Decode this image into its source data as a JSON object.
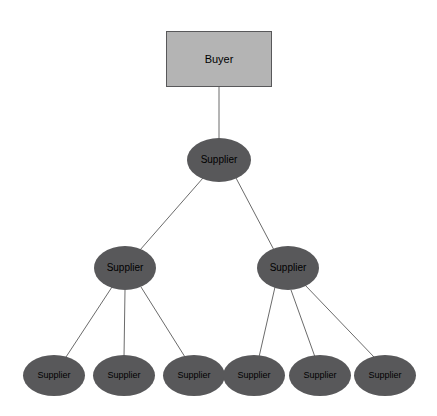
{
  "diagram": {
    "type": "tree",
    "background_color": "#ffffff",
    "style": {
      "buyer_fill": "#b4b4b4",
      "buyer_border": "#58585a",
      "supplier_fill": "#58585a",
      "label_color": "#000000",
      "edge_color": "#6b6b6b"
    },
    "nodes": [
      {
        "id": "buyer",
        "label": "Buyer",
        "shape": "rectangle",
        "tier": 0,
        "x": 219,
        "y": 59,
        "width": 106,
        "height": 56
      },
      {
        "id": "s1",
        "label": "Supplier",
        "shape": "ellipse",
        "tier": 1,
        "x": 219,
        "y": 160,
        "width": 64,
        "height": 44
      },
      {
        "id": "s2a",
        "label": "Supplier",
        "shape": "ellipse",
        "tier": 2,
        "x": 125,
        "y": 268,
        "width": 62,
        "height": 44
      },
      {
        "id": "s2b",
        "label": "Supplier",
        "shape": "ellipse",
        "tier": 2,
        "x": 288,
        "y": 268,
        "width": 62,
        "height": 44
      },
      {
        "id": "s3a",
        "label": "Supplier",
        "shape": "ellipse",
        "tier": 3,
        "x": 54,
        "y": 375,
        "width": 62,
        "height": 41
      },
      {
        "id": "s3b",
        "label": "Supplier",
        "shape": "ellipse",
        "tier": 3,
        "x": 124,
        "y": 375,
        "width": 62,
        "height": 41
      },
      {
        "id": "s3c",
        "label": "Supplier",
        "shape": "ellipse",
        "tier": 3,
        "x": 194,
        "y": 375,
        "width": 62,
        "height": 41
      },
      {
        "id": "s3d",
        "label": "Supplier",
        "shape": "ellipse",
        "tier": 3,
        "x": 254,
        "y": 375,
        "width": 62,
        "height": 41
      },
      {
        "id": "s3e",
        "label": "Supplier",
        "shape": "ellipse",
        "tier": 3,
        "x": 320,
        "y": 375,
        "width": 62,
        "height": 41
      },
      {
        "id": "s3f",
        "label": "Supplier",
        "shape": "ellipse",
        "tier": 3,
        "x": 385,
        "y": 375,
        "width": 62,
        "height": 41
      }
    ],
    "edges": [
      {
        "from": "buyer",
        "to": "s1",
        "x1": 219,
        "y1": 87,
        "x2": 219,
        "y2": 139
      },
      {
        "from": "s1",
        "to": "s2a",
        "x1": 203,
        "y1": 178,
        "x2": 140,
        "y2": 250
      },
      {
        "from": "s1",
        "to": "s2b",
        "x1": 236,
        "y1": 178,
        "x2": 274,
        "y2": 250
      },
      {
        "from": "s2a",
        "to": "s3a",
        "x1": 112,
        "y1": 287,
        "x2": 66,
        "y2": 357
      },
      {
        "from": "s2a",
        "to": "s3b",
        "x1": 125,
        "y1": 290,
        "x2": 124,
        "y2": 357
      },
      {
        "from": "s2a",
        "to": "s3c",
        "x1": 141,
        "y1": 287,
        "x2": 185,
        "y2": 357
      },
      {
        "from": "s2b",
        "to": "s3d",
        "x1": 275,
        "y1": 287,
        "x2": 259,
        "y2": 357
      },
      {
        "from": "s2b",
        "to": "s3e",
        "x1": 291,
        "y1": 290,
        "x2": 315,
        "y2": 357
      },
      {
        "from": "s2b",
        "to": "s3f",
        "x1": 305,
        "y1": 285,
        "x2": 374,
        "y2": 357
      }
    ]
  }
}
